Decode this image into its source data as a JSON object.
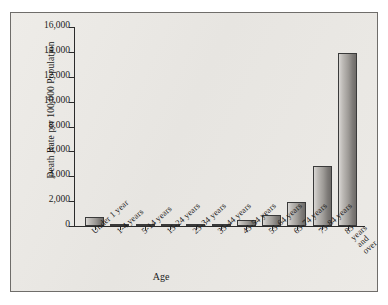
{
  "chart_data": {
    "type": "bar",
    "title": "",
    "xlabel": "Age",
    "ylabel": "Death Rate per 100,000 Population",
    "categories": [
      "Under 1 year",
      "1-4 years",
      "5-14 years",
      "15-24 years",
      "25-34 years",
      "35-44 years",
      "45-54 years",
      "55-64 years",
      "65-74 years",
      "75-84 years",
      "85 years\nand over"
    ],
    "values": [
      700,
      35,
      20,
      80,
      105,
      200,
      450,
      900,
      1900,
      4800,
      13900
    ],
    "ylim": [
      0,
      16000
    ],
    "ytick_labels": [
      "0",
      "2,000",
      "4,000",
      "6,000",
      "8,000",
      "10,000",
      "12,000",
      "14,000",
      "16,000"
    ],
    "ytick_values": [
      0,
      2000,
      4000,
      6000,
      8000,
      10000,
      12000,
      14000,
      16000
    ],
    "grid": false,
    "legend": null,
    "bar_fill_light": "#d8d6d3",
    "bar_fill_dark": "#6e6b68",
    "bar_border_color": "#3a3a3a",
    "axis_color": "#2b2b2b",
    "panel_background": "#ebe9e5"
  }
}
